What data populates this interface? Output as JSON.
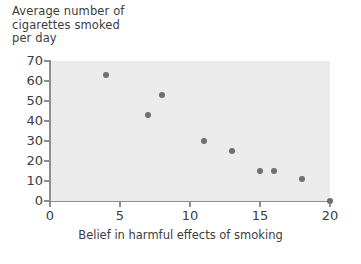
{
  "chart_data": {
    "type": "scatter",
    "title": "",
    "xlabel": "Belief in harmful effects of smoking",
    "ylabel": "Average number of\ncigarettes smoked\nper day",
    "xlim": [
      0,
      20
    ],
    "ylim": [
      0,
      70
    ],
    "grid": false,
    "legend": null,
    "background_color": "#ebebeb",
    "point_color": "#6e6e6e",
    "axis_color": "#8e8e8e",
    "xticks": [
      0,
      5,
      10,
      15,
      20
    ],
    "xtick_labels": [
      "0",
      "5",
      "10",
      "15",
      "20"
    ],
    "yticks": [
      0,
      10,
      20,
      30,
      40,
      50,
      60,
      70
    ],
    "ytick_labels": [
      "0",
      "10",
      "20",
      "30",
      "40",
      "50",
      "60",
      "70"
    ],
    "x": [
      4,
      7,
      8,
      11,
      13,
      15,
      16,
      18,
      20
    ],
    "y": [
      63,
      43,
      53,
      30,
      25,
      15,
      15,
      11,
      0
    ],
    "points": [
      {
        "x": 4,
        "y": 63
      },
      {
        "x": 7,
        "y": 43
      },
      {
        "x": 8,
        "y": 53
      },
      {
        "x": 11,
        "y": 30
      },
      {
        "x": 13,
        "y": 25
      },
      {
        "x": 15,
        "y": 15
      },
      {
        "x": 16,
        "y": 15
      },
      {
        "x": 18,
        "y": 11
      },
      {
        "x": 20,
        "y": 0
      }
    ]
  },
  "labels": {
    "y_axis_title": "Average number of\ncigarettes smoked\nper day",
    "x_axis_title": "Belief in harmful effects of smoking"
  }
}
